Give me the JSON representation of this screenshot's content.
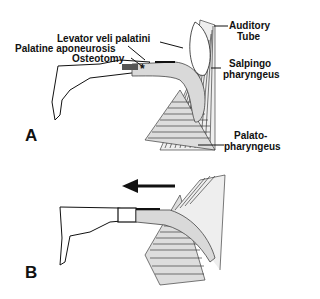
{
  "figure": {
    "panels": [
      {
        "id": "A",
        "label": "A"
      },
      {
        "id": "B",
        "label": "B"
      }
    ],
    "labels": {
      "levator": "Levator veli palatini",
      "aponeurosis": "Palatine aponeurosis",
      "osteotomy": "Osteotomy",
      "auditory1": "Auditory",
      "auditory2": "Tube",
      "salpingo1": "Salpingo",
      "salpingo2": "pharyngeus",
      "palato1": "Palato-",
      "palato2": "pharyngeus"
    },
    "markers": {
      "osteotomy_mark": "*"
    },
    "arrow": {
      "direction": "left"
    },
    "colors": {
      "ink": "#111111",
      "muscle_fill": "#d9d9d9",
      "background": "#ffffff"
    }
  }
}
